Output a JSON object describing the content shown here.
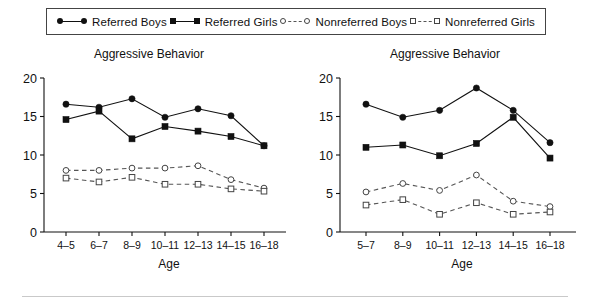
{
  "legend": {
    "items": [
      {
        "label": "Referred Boys",
        "marker": "filled-circle",
        "line": "solid"
      },
      {
        "label": "Referred Girls",
        "marker": "filled-square",
        "line": "solid"
      },
      {
        "label": "Nonreferred Boys",
        "marker": "open-circle",
        "line": "dashed"
      },
      {
        "label": "Nonreferred Girls",
        "marker": "open-square",
        "line": "dashed"
      }
    ]
  },
  "colors": {
    "solid_line": "#111111",
    "dashed_line": "#555555",
    "axis": "#111111",
    "background": "#ffffff",
    "legend_border": "#444444",
    "bottom_rule": "#c9c9c9"
  },
  "chart_data": [
    {
      "type": "line",
      "title": "Aggressive Behavior",
      "xlabel": "Age",
      "ylabel": "",
      "categories": [
        "4–5",
        "6–7",
        "8–9",
        "10–11",
        "12–13",
        "14–15",
        "16–18"
      ],
      "yticks": [
        0,
        5,
        10,
        15,
        20
      ],
      "ylim": [
        0,
        20
      ],
      "grid": false,
      "legend_position": "top-external",
      "series": [
        {
          "name": "Referred Boys",
          "marker": "filled-circle",
          "line": "solid",
          "values": [
            16.6,
            16.2,
            17.3,
            14.9,
            16.0,
            15.1,
            11.2
          ]
        },
        {
          "name": "Referred Girls",
          "marker": "filled-square",
          "line": "solid",
          "values": [
            14.6,
            15.7,
            12.1,
            13.7,
            13.1,
            12.4,
            11.2
          ]
        },
        {
          "name": "Nonreferred Boys",
          "marker": "open-circle",
          "line": "dashed",
          "values": [
            8.0,
            8.0,
            8.3,
            8.3,
            8.6,
            6.8,
            5.7
          ]
        },
        {
          "name": "Nonreferred Girls",
          "marker": "open-square",
          "line": "dashed",
          "values": [
            7.0,
            6.5,
            7.1,
            6.2,
            6.2,
            5.6,
            5.3
          ]
        }
      ]
    },
    {
      "type": "line",
      "title": "Aggressive Behavior",
      "xlabel": "Age",
      "ylabel": "",
      "categories": [
        "5–7",
        "8–9",
        "10–11",
        "12–13",
        "14–15",
        "16–18"
      ],
      "yticks": [
        0,
        5,
        10,
        15,
        20
      ],
      "ylim": [
        0,
        20
      ],
      "grid": false,
      "legend_position": "top-external",
      "series": [
        {
          "name": "Referred Boys",
          "marker": "filled-circle",
          "line": "solid",
          "values": [
            16.6,
            14.9,
            15.8,
            18.7,
            15.8,
            11.6
          ]
        },
        {
          "name": "Referred Girls",
          "marker": "filled-square",
          "line": "solid",
          "values": [
            11.0,
            11.3,
            9.9,
            11.5,
            14.9,
            9.6
          ]
        },
        {
          "name": "Nonreferred Boys",
          "marker": "open-circle",
          "line": "dashed",
          "values": [
            5.2,
            6.3,
            5.4,
            7.4,
            4.0,
            3.3
          ]
        },
        {
          "name": "Nonreferred Girls",
          "marker": "open-square",
          "line": "dashed",
          "values": [
            3.5,
            4.2,
            2.3,
            3.8,
            2.3,
            2.6
          ]
        }
      ]
    }
  ]
}
